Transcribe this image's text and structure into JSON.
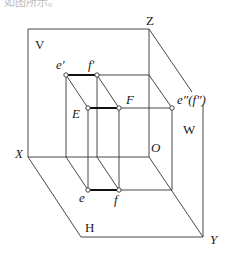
{
  "caption_fragment": "如图所示。",
  "labels": {
    "V": "V",
    "H": "H",
    "W": "W",
    "X": "X",
    "Y": "Y",
    "Z": "Z",
    "O": "O",
    "e_prime": "e′",
    "f_prime": "f′",
    "E": "E",
    "F": "F",
    "e_dprime": "e″(f″)",
    "e": "e",
    "f": "f"
  }
}
